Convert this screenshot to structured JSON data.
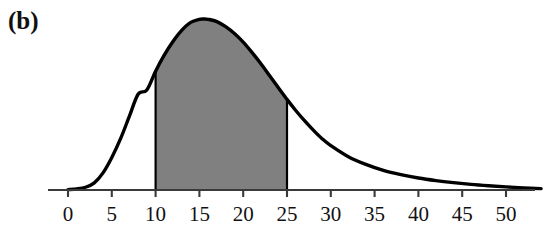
{
  "figure": {
    "panel_label": "(b)",
    "background_color": "#ffffff",
    "curve_color": "#000000",
    "shade_color": "#808080",
    "axis_color": "#3a3a3a"
  },
  "chart_data": {
    "type": "area",
    "title": "",
    "subtitle": "",
    "xlabel": "",
    "ylabel": "",
    "grid": false,
    "legend": null,
    "annotations": [
      "(b)"
    ],
    "xlim": [
      -2.3,
      55.5
    ],
    "ylim": [
      0,
      1.08
    ],
    "xticks": [
      0,
      5,
      10,
      15,
      20,
      25,
      30,
      35,
      40,
      45,
      50
    ],
    "xtick_labels": [
      "0",
      "5",
      "10",
      "15",
      "20",
      "25",
      "30",
      "35",
      "40",
      "45",
      "50"
    ],
    "yticks": [],
    "ytick_labels": [],
    "shaded_region": {
      "x_start": 10,
      "x_end": 25,
      "fill": "#808080",
      "edge": "#000000"
    },
    "peak": {
      "x": 15.5,
      "y": 1.0
    },
    "series": [
      {
        "name": "density",
        "x": [
          0,
          1,
          2,
          3,
          4,
          5,
          6,
          7,
          8,
          9,
          10,
          11,
          12,
          13,
          14,
          15,
          15.5,
          16,
          17,
          18,
          19,
          20,
          21,
          22,
          23,
          24,
          25,
          26,
          27,
          28,
          29,
          30,
          32,
          34,
          36,
          38,
          40,
          42,
          44,
          46,
          48,
          50,
          52,
          54
        ],
        "y": [
          0.002,
          0.006,
          0.016,
          0.042,
          0.1,
          0.19,
          0.3,
          0.43,
          0.56,
          0.585,
          0.695,
          0.79,
          0.87,
          0.935,
          0.98,
          0.998,
          1.0,
          0.998,
          0.985,
          0.955,
          0.915,
          0.865,
          0.805,
          0.74,
          0.67,
          0.6,
          0.53,
          0.465,
          0.405,
          0.35,
          0.3,
          0.26,
          0.195,
          0.15,
          0.115,
          0.09,
          0.07,
          0.055,
          0.043,
          0.033,
          0.025,
          0.018,
          0.012,
          0.008
        ]
      }
    ]
  },
  "axis_geometry": {
    "x_origin_px": 68,
    "px_per_unit": 8.76,
    "baseline_y_px": 190,
    "peak_y_px": 19,
    "axis_left_px": 48,
    "axis_right_px": 535,
    "tick_length_px": 7
  }
}
